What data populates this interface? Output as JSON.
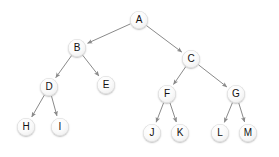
{
  "diagram": {
    "kind": "binary-tree",
    "canvas": {
      "width": 279,
      "height": 157,
      "background": "#ffffff"
    },
    "style": {
      "node_diameter": 18,
      "node_fill": "#f5f5f5",
      "node_highlight": "#ffffff",
      "node_shadow": "#9a9a9a",
      "label_color": "#111111",
      "edge_color": "#8a8a8a",
      "edge_width": 1,
      "arrowhead": "solid-triangle"
    },
    "nodes": [
      {
        "id": "A",
        "label": "A",
        "x": 139,
        "y": 20,
        "depth": 0,
        "parent": null
      },
      {
        "id": "B",
        "label": "B",
        "x": 77,
        "y": 48,
        "depth": 1,
        "parent": "A"
      },
      {
        "id": "C",
        "label": "C",
        "x": 191,
        "y": 59,
        "depth": 1,
        "parent": "A"
      },
      {
        "id": "D",
        "label": "D",
        "x": 49,
        "y": 87,
        "depth": 2,
        "parent": "B"
      },
      {
        "id": "E",
        "label": "E",
        "x": 106,
        "y": 85,
        "depth": 2,
        "parent": "B"
      },
      {
        "id": "F",
        "label": "F",
        "x": 167,
        "y": 94,
        "depth": 2,
        "parent": "C"
      },
      {
        "id": "G",
        "label": "G",
        "x": 236,
        "y": 94,
        "depth": 2,
        "parent": "C"
      },
      {
        "id": "H",
        "label": "H",
        "x": 26,
        "y": 127,
        "depth": 3,
        "parent": "D"
      },
      {
        "id": "I",
        "label": "I",
        "x": 60,
        "y": 127,
        "depth": 3,
        "parent": "D"
      },
      {
        "id": "J",
        "label": "J",
        "x": 152,
        "y": 133,
        "depth": 3,
        "parent": "F"
      },
      {
        "id": "K",
        "label": "K",
        "x": 180,
        "y": 133,
        "depth": 3,
        "parent": "F"
      },
      {
        "id": "L",
        "label": "L",
        "x": 220,
        "y": 133,
        "depth": 3,
        "parent": "G"
      },
      {
        "id": "M",
        "label": "M",
        "x": 248,
        "y": 133,
        "depth": 3,
        "parent": "G"
      }
    ],
    "edges": [
      {
        "from": "A",
        "to": "B",
        "directed": true
      },
      {
        "from": "A",
        "to": "C",
        "directed": true
      },
      {
        "from": "B",
        "to": "D",
        "directed": true
      },
      {
        "from": "B",
        "to": "E",
        "directed": true
      },
      {
        "from": "C",
        "to": "F",
        "directed": true
      },
      {
        "from": "C",
        "to": "G",
        "directed": true
      },
      {
        "from": "D",
        "to": "H",
        "directed": true
      },
      {
        "from": "D",
        "to": "I",
        "directed": true
      },
      {
        "from": "F",
        "to": "J",
        "directed": true
      },
      {
        "from": "F",
        "to": "K",
        "directed": true
      },
      {
        "from": "G",
        "to": "L",
        "directed": true
      },
      {
        "from": "G",
        "to": "M",
        "directed": true
      }
    ]
  }
}
